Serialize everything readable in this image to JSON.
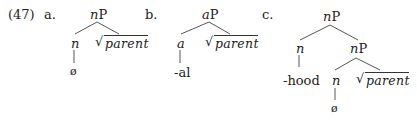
{
  "example_number": "(47)",
  "trees": [
    {
      "label": "a.",
      "root": {
        "cat_italic": "n",
        "cat_rest": "P"
      },
      "left": {
        "cat": "n",
        "exponent": "ø"
      },
      "right": {
        "sqrt": "√",
        "root": "parent"
      }
    },
    {
      "label": "b.",
      "root": {
        "cat_italic": "a",
        "cat_rest": "P"
      },
      "left": {
        "cat": "a",
        "exponent": "-al"
      },
      "right": {
        "sqrt": "√",
        "root": "parent"
      }
    },
    {
      "label": "c.",
      "root": {
        "cat_italic": "n",
        "cat_rest": "P"
      },
      "left": {
        "cat": "n",
        "exponent": "-hood"
      },
      "right": {
        "cat_italic": "n",
        "cat_rest": "P",
        "left": {
          "cat": "n",
          "exponent": "ø"
        },
        "right": {
          "sqrt": "√",
          "root": "parent"
        }
      }
    }
  ]
}
